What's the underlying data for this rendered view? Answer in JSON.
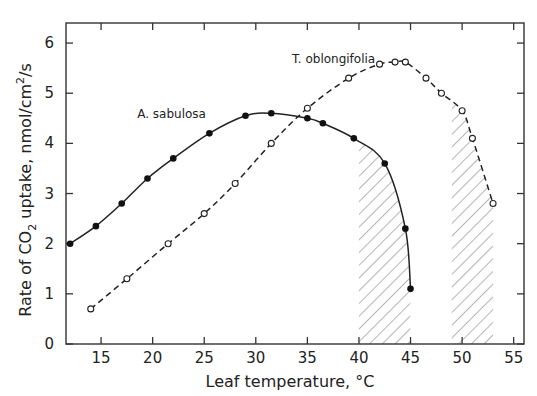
{
  "chart_data": {
    "type": "line",
    "title": "",
    "xlabel": "Leaf temperature, °C",
    "ylabel_parts": {
      "pre": "Rate of CO",
      "sub": "2",
      "mid": " uptake,  nmol/cm",
      "sup": "2",
      "post": "/s"
    },
    "ylabel": "Rate of CO2 uptake, nmol/cm2/s",
    "xlim": [
      11.6,
      56
    ],
    "ylim": [
      0,
      6.4
    ],
    "xticks": [
      15,
      20,
      25,
      30,
      35,
      40,
      45,
      50,
      55
    ],
    "yticks": [
      0,
      1,
      2,
      3,
      4,
      5,
      6
    ],
    "grid": false,
    "legend": "inline labels",
    "series": [
      {
        "name": "A. sabulosa",
        "marker": "filled-circle",
        "line": "solid",
        "x": [
          12,
          14.5,
          17,
          19.5,
          22,
          25.5,
          29,
          31.5,
          35,
          36.5,
          39.5,
          42.5,
          44.5,
          45
        ],
        "y": [
          2.0,
          2.35,
          2.8,
          3.3,
          3.7,
          4.2,
          4.55,
          4.6,
          4.5,
          4.4,
          4.1,
          3.6,
          2.3,
          1.1
        ],
        "label_pos": [
          18.5,
          4.5
        ]
      },
      {
        "name": "T. oblongifolia",
        "marker": "open-circle",
        "line": "dashed",
        "x": [
          14,
          17.5,
          21.5,
          25,
          28,
          31.5,
          35,
          39,
          42,
          43.5,
          44.5,
          46.5,
          48,
          50,
          51,
          53
        ],
        "y": [
          0.7,
          1.3,
          2.0,
          2.6,
          3.2,
          4.0,
          4.7,
          5.3,
          5.58,
          5.62,
          5.62,
          5.3,
          5.0,
          4.65,
          4.1,
          2.8
        ],
        "label_pos": [
          33.5,
          5.6
        ]
      }
    ],
    "shaded_regions": [
      {
        "x0": 40,
        "x1": 45,
        "pattern": "diagonal-hatch",
        "bounded_by": "A. sabulosa"
      },
      {
        "x0": 49,
        "x1": 53,
        "pattern": "diagonal-hatch",
        "bounded_by": "T. oblongifolia"
      }
    ]
  }
}
